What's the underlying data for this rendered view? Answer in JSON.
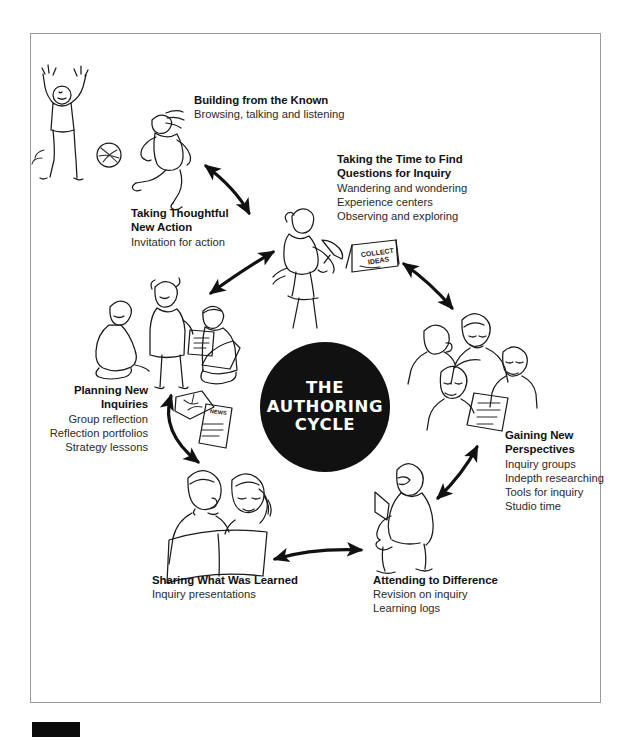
{
  "figure": {
    "title": "The Authoring Cycle",
    "center": {
      "line1": "THE",
      "line2": "AUTHORING",
      "line3": "CYCLE",
      "bg_color": "#111111",
      "text_color": "#ffffff"
    },
    "border_color": "#9a9a9a",
    "stages": [
      {
        "id": "building-from-the-known",
        "heading": "Building from the Known",
        "details": [
          "Browsing, talking and listening"
        ],
        "align": "left"
      },
      {
        "id": "taking-the-time-to-find-questions-for-inquiry",
        "heading_line1": "Taking the Time to Find",
        "heading_line2": "Questions for Inquiry",
        "details": [
          "Wandering and wondering",
          "Experience centers",
          "Observing and exploring"
        ],
        "align": "left"
      },
      {
        "id": "gaining-new-perspectives",
        "heading_line1": "Gaining New",
        "heading_line2": "Perspectives",
        "details": [
          "Inquiry groups",
          "Indepth researching",
          "Tools for inquiry",
          "Studio time"
        ],
        "align": "left"
      },
      {
        "id": "attending-to-difference",
        "heading": "Attending to Difference",
        "details": [
          "Revision on inquiry",
          "Learning logs"
        ],
        "align": "left"
      },
      {
        "id": "sharing-what-was-learned",
        "heading": "Sharing What Was Learned",
        "details": [
          "Inquiry presentations"
        ],
        "align": "left"
      },
      {
        "id": "planning-new-inquiries",
        "heading_line1": "Planning New",
        "heading_line2": "Inquiries",
        "details": [
          "Group reflection",
          "Reflection portfolios",
          "Strategy lessons"
        ],
        "align": "right"
      },
      {
        "id": "taking-thoughtful-new-action",
        "heading_line1": "Taking Thoughtful",
        "heading_line2": "New Action",
        "details": [
          "Invitation for action"
        ],
        "align": "left"
      }
    ],
    "props": {
      "collect_ideas_sign_line1": "COLLECT",
      "collect_ideas_sign_line2": "IDEAS",
      "news_sheet_label": "NEWS"
    },
    "illustrations": [
      "cheering-person",
      "person-kicking-ball",
      "person-with-easel-collecting-ideas",
      "group-of-four-discussing-document",
      "seated-person-writing",
      "two-people-sharing-book",
      "small-group-reflecting"
    ]
  }
}
